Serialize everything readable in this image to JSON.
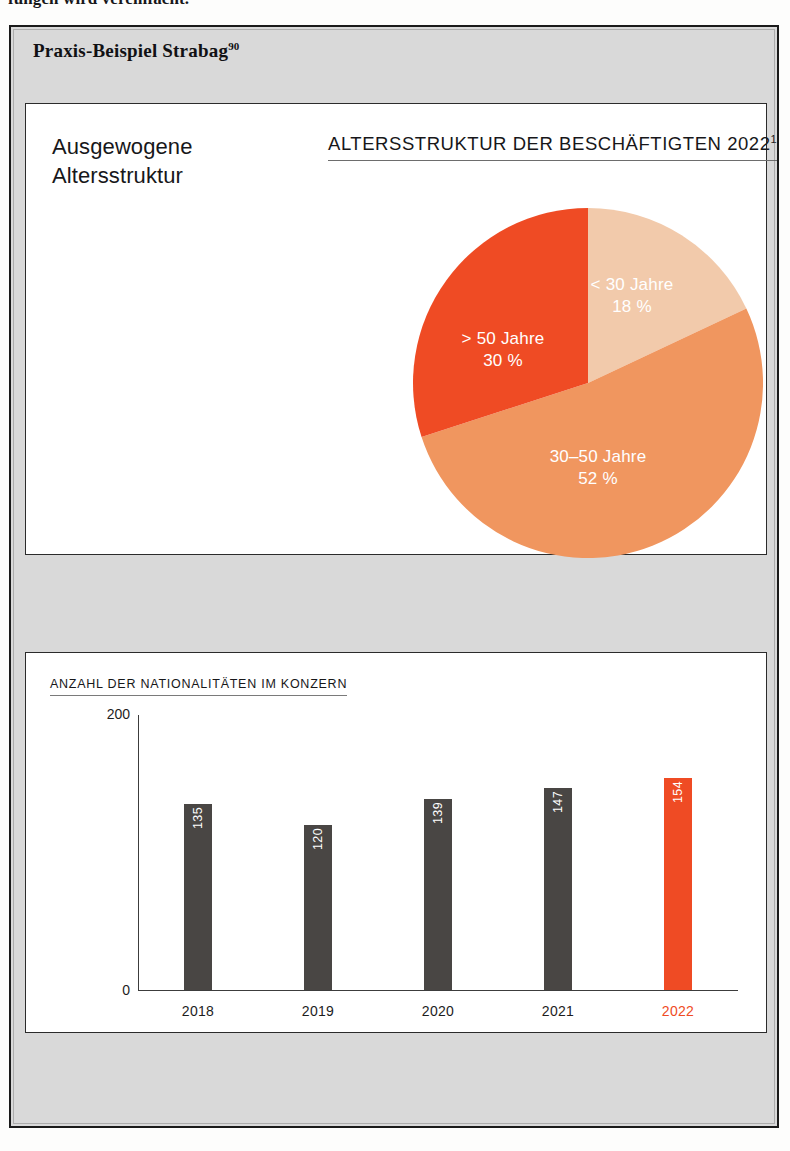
{
  "page": {
    "running_text_clipped": "fungen wird vereinfacht.",
    "box_heading": "Praxis-Beispiel Strabag",
    "box_heading_superscript": "90"
  },
  "colors": {
    "accent_red": "#ef4b24",
    "mid_orange": "#f0965f",
    "light_peach": "#f2caab",
    "bar_gray": "#494644",
    "box_background": "#d9d9d9",
    "panel_background": "#ffffff",
    "frame_border": "#1a1a1a"
  },
  "pie_panel": {
    "caption_line1": "Ausgewogene",
    "caption_line2": "Altersstruktur",
    "title": "ALTERSSTRUKTUR DER BESCHÄFTIGTEN 2022",
    "title_superscript": "1"
  },
  "bar_panel": {
    "title": "ANZAHL DER NATIONALITÄTEN IM KONZERN"
  },
  "chart_data": [
    {
      "type": "pie",
      "title": "ALTERSSTRUKTUR DER BESCHÄFTIGTEN 2022",
      "start_angle_deg": 0,
      "direction": "clockwise",
      "slices": [
        {
          "label": "< 30 Jahre",
          "value": 18,
          "value_label": "18 %",
          "color": "#f2caab"
        },
        {
          "label": "30–50 Jahre",
          "value": 52,
          "value_label": "52 %",
          "color": "#f0965f"
        },
        {
          "label": "> 50 Jahre",
          "value": 30,
          "value_label": "30 %",
          "color": "#ef4b24"
        }
      ],
      "unit": "%",
      "total": 100
    },
    {
      "type": "bar",
      "title": "ANZAHL DER NATIONALITÄTEN IM KONZERN",
      "categories": [
        "2018",
        "2019",
        "2020",
        "2021",
        "2022"
      ],
      "values": [
        135,
        120,
        139,
        147,
        154
      ],
      "xlabel": "",
      "ylabel": "",
      "ylim": [
        0,
        200
      ],
      "ytick_labels": [
        "200",
        "0"
      ],
      "grid": false,
      "legend": false,
      "bar_colors": [
        "#494644",
        "#494644",
        "#494644",
        "#494644",
        "#ef4b24"
      ],
      "highlight_category": "2022"
    }
  ]
}
